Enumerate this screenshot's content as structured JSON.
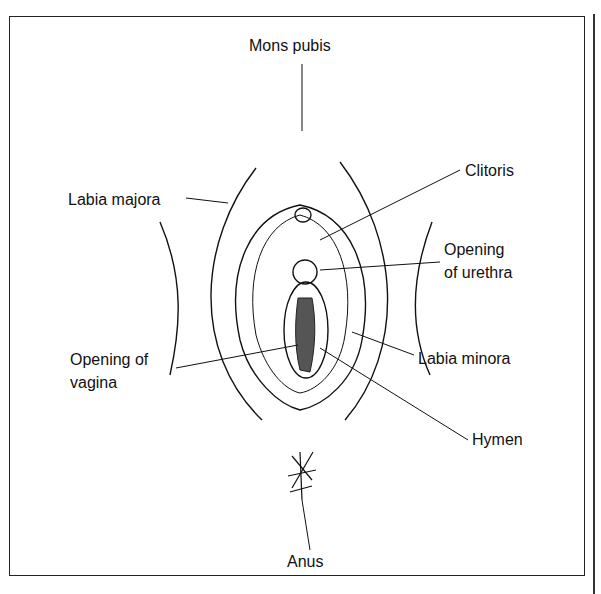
{
  "diagram": {
    "labels": {
      "mons_pubis": "Mons pubis",
      "clitoris": "Clitoris",
      "labia_majora": "Labia majora",
      "opening_urethra_1": "Opening",
      "opening_urethra_2": "of urethra",
      "opening_vagina_1": "Opening of",
      "opening_vagina_2": "vagina",
      "labia_minora": "Labia minora",
      "hymen": "Hymen",
      "anus": "Anus"
    }
  }
}
